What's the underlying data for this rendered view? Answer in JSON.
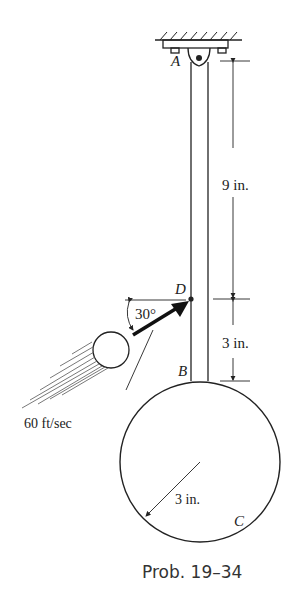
{
  "figure": {
    "caption": "Prob. 19–34",
    "points": {
      "A": "A",
      "B": "B",
      "C": "C",
      "D": "D"
    },
    "dimensions": {
      "upper": "9 in.",
      "lower": "3 in.",
      "radius": "3 in."
    },
    "angle_label": "30°",
    "velocity_label": "60 ft/sec",
    "colors": {
      "ink": "#222222",
      "background": "#ffffff"
    }
  }
}
